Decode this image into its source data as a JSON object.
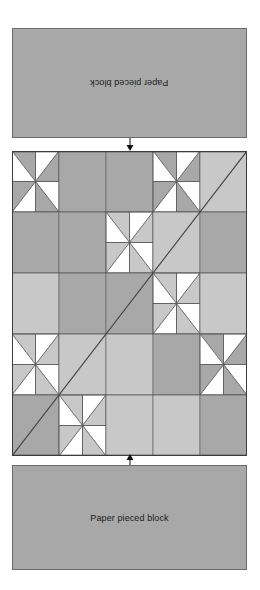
{
  "page": {
    "background": "#ffffff",
    "width": 260,
    "height": 590
  },
  "top_note": {
    "label": "Paper pieced block",
    "rotated": "180deg",
    "fill": "#a8a8a8",
    "stroke": "#6b6b6b"
  },
  "bottom_note": {
    "label": "Paper pieced block",
    "fill": "#a8a8a8",
    "stroke": "#6b6b6b"
  },
  "arrows": {
    "top": "arrow-down-icon",
    "bottom": "arrow-up-icon",
    "color": "#111111"
  },
  "quilt": {
    "title": "Paper pieced quilt block diagram",
    "grid_rows": 5,
    "grid_cols": 5,
    "cell_size": 47,
    "colors": {
      "dark": "#a8a8a8",
      "light": "#c8c8c8",
      "white": "#ffffff",
      "line": "#5a5a5a",
      "border": "#3d3d3d"
    },
    "diagonal": {
      "description": "long diagonal seam from top-right to bottom-left corner",
      "from": [
        235,
        0
      ],
      "to": [
        0,
        235
      ]
    },
    "cells": [
      [
        {
          "type": "pinwheel",
          "tone": "dark"
        },
        {
          "type": "solid",
          "tone": "dark"
        },
        {
          "type": "solid",
          "tone": "dark"
        },
        {
          "type": "pinwheel",
          "tone": "dark"
        },
        {
          "type": "solid",
          "tone": "light"
        }
      ],
      [
        {
          "type": "solid",
          "tone": "dark"
        },
        {
          "type": "solid",
          "tone": "dark"
        },
        {
          "type": "pinwheel",
          "tone": "light"
        },
        {
          "type": "solid",
          "tone": "light"
        },
        {
          "type": "solid",
          "tone": "dark"
        }
      ],
      [
        {
          "type": "solid",
          "tone": "light"
        },
        {
          "type": "solid",
          "tone": "dark"
        },
        {
          "type": "solid",
          "tone": "dark"
        },
        {
          "type": "pinwheel",
          "tone": "light"
        },
        {
          "type": "solid",
          "tone": "light"
        }
      ],
      [
        {
          "type": "pinwheel",
          "tone": "light"
        },
        {
          "type": "solid",
          "tone": "light"
        },
        {
          "type": "solid",
          "tone": "light"
        },
        {
          "type": "solid",
          "tone": "dark"
        },
        {
          "type": "pinwheel",
          "tone": "dark"
        }
      ],
      [
        {
          "type": "solid",
          "tone": "dark"
        },
        {
          "type": "pinwheel",
          "tone": "light"
        },
        {
          "type": "solid",
          "tone": "light"
        },
        {
          "type": "solid",
          "tone": "light"
        },
        {
          "type": "solid",
          "tone": "dark"
        }
      ]
    ]
  }
}
